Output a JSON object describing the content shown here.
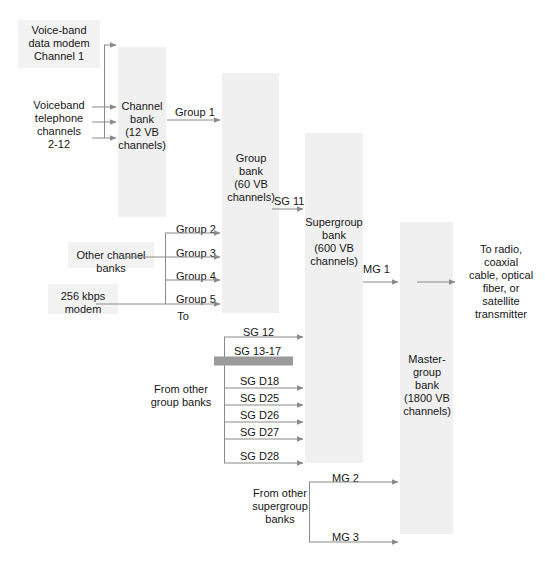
{
  "figure": {
    "type": "fdm-multiplexing-hierarchy-diagram",
    "background": "#ffffff",
    "wire_color": "#8a8a8a",
    "block_fill": "#f0f0f0",
    "thick_arrow_color": "#9a9a9a"
  },
  "blocks": {
    "channel_bank": {
      "label": "Channel\nbank\n(12 VB\nchannels)"
    },
    "group_bank": {
      "label": "Group\nbank\n(60 VB\nchannels)"
    },
    "supergroup_bank": {
      "label": "Supergroup\nbank\n(600 VB\nchannels)"
    },
    "mastergroup_bank": {
      "label": "Master-\ngroup\nbank\n(1800 VB\nchannels)"
    }
  },
  "inputs": {
    "voiceband_data_modem": "Voice-band\ndata modem\nChannel 1",
    "voiceband_telephone": "Voiceband\ntelephone\nchannels\n2-12",
    "other_channel_banks": "Other channel\nbanks",
    "modem_256kbps": "256 kbps\nmodem",
    "from_other_group_banks": "From other\ngroup banks",
    "from_other_supergroup_banks": "From other\nsupergroup\nbanks"
  },
  "outputs": {
    "transmitter": "To radio,\ncoaxial\ncable, optical\nfiber, or\nsatellite\ntransmitter"
  },
  "links": {
    "group_1": "Group 1",
    "group_2": "Group 2",
    "group_3": "Group 3",
    "group_4": "Group 4",
    "group_5": "Group 5",
    "to_label": "To",
    "sg_11": "SG 11",
    "sg_12": "SG 12",
    "sg_13_17": "SG 13-17",
    "sg_d18": "SG D18",
    "sg_d25": "SG D25",
    "sg_d26": "SG D26",
    "sg_d27": "SG D27",
    "sg_d28": "SG D28",
    "mg_1": "MG 1",
    "mg_2": "MG 2",
    "mg_3": "MG 3"
  }
}
